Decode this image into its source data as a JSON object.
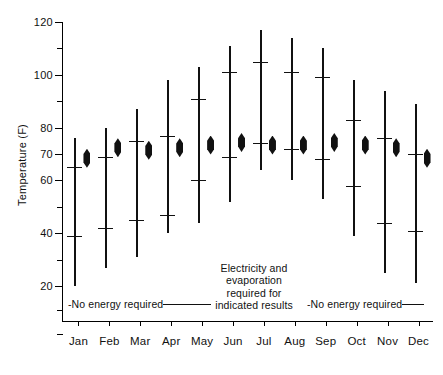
{
  "chart_data": {
    "type": "bar",
    "title": "",
    "xlabel": "",
    "ylabel": "Temperature (F)",
    "ylim": [
      10,
      120
    ],
    "ytick_labels": [
      "120",
      "100",
      "80",
      "70",
      "60",
      "40",
      "20"
    ],
    "ytick_values": [
      120,
      100,
      80,
      70,
      60,
      40,
      20
    ],
    "ytick_minor_values": [
      110,
      90,
      50,
      30
    ],
    "grid": false,
    "legend": null,
    "categories": [
      "Jan",
      "Feb",
      "Mar",
      "Apr",
      "May",
      "Jun",
      "Jul",
      "Aug",
      "Sep",
      "Oct",
      "Nov",
      "Dec"
    ],
    "series": [
      {
        "name": "range_max",
        "values": [
          76,
          80,
          87,
          98,
          103,
          111,
          117,
          114,
          110,
          98,
          94,
          89
        ]
      },
      {
        "name": "upper_bar",
        "values": [
          65,
          69,
          75,
          77,
          91,
          101,
          105,
          101,
          99,
          83,
          76,
          70
        ]
      },
      {
        "name": "lower_bar",
        "values": [
          39,
          42,
          45,
          47,
          60,
          69,
          74,
          72,
          68,
          58,
          44,
          41
        ]
      },
      {
        "name": "range_min",
        "values": [
          20,
          27,
          31,
          40,
          44,
          52,
          64,
          60,
          53,
          39,
          25,
          21
        ]
      },
      {
        "name": "diamond_marker",
        "values": [
          72,
          76,
          75,
          76,
          77,
          78,
          77,
          77,
          78,
          77,
          76,
          72
        ]
      }
    ],
    "annotations": [
      {
        "id": "left-note",
        "text": "-No energy required",
        "trailing_rule": true
      },
      {
        "id": "center-note",
        "lines": [
          "Electricity and",
          "evaporation",
          "required for",
          "indicated results"
        ]
      },
      {
        "id": "right-note",
        "text": "-No energy required",
        "trailing_rule": true
      }
    ]
  },
  "axis": {
    "y_title": "Temperature (F)"
  },
  "colors": {
    "ink": "#111111",
    "axis": "#000000",
    "background": "#ffffff"
  }
}
